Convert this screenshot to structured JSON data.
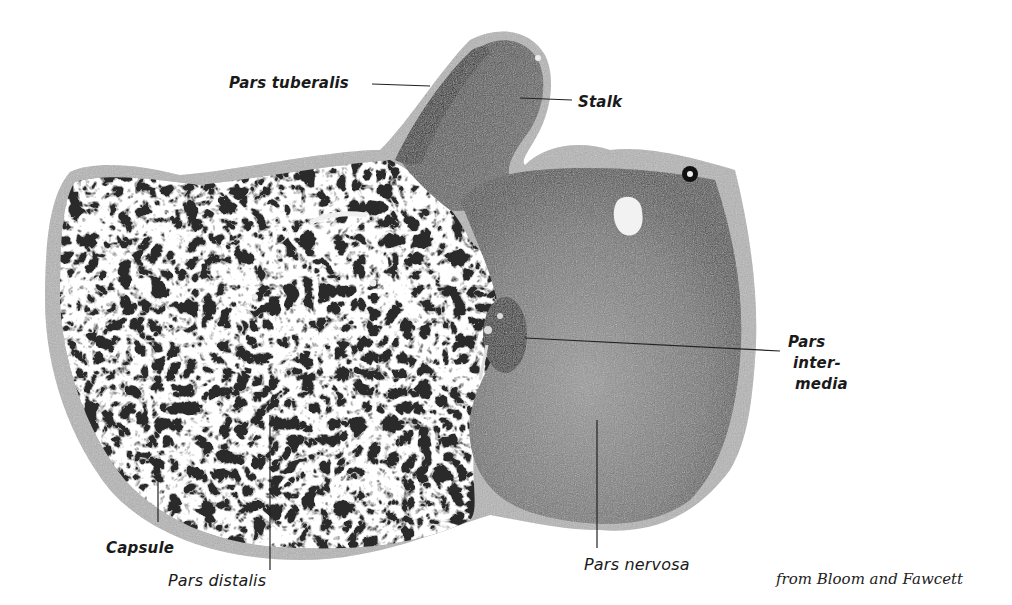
{
  "figure": {
    "labels": {
      "pars_tuberalis": "Pars tuberalis",
      "stalk": "Stalk",
      "pars_intermedia": [
        "Pars",
        "inter-",
        "media"
      ],
      "capsule": "Capsule",
      "pars_distalis": "Pars distalis",
      "pars_nervosa": "Pars nervosa"
    },
    "credit": "from Bloom and Fawcett"
  },
  "colors": {
    "background": "#ffffff",
    "ink": "#1a1a1a",
    "distalis_dark": "#2a2a2a",
    "nervosa_mid": "#6e6e6e",
    "capsule_light": "#b8b8b8"
  }
}
